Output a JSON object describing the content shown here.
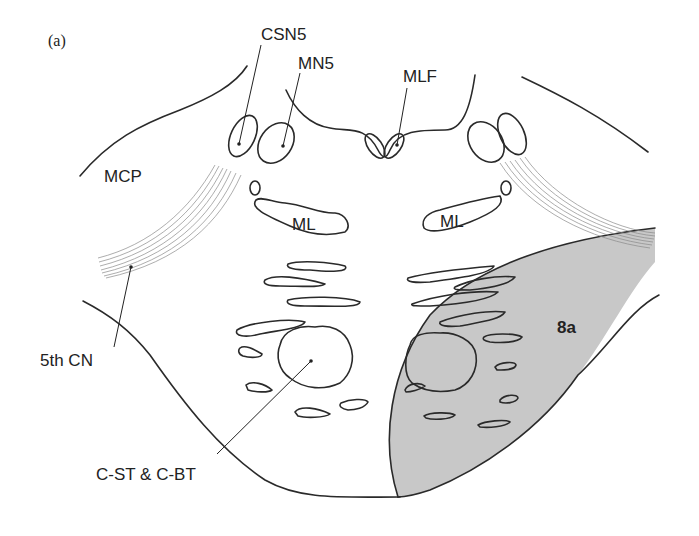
{
  "figure": {
    "panel_label": "(a)",
    "colors": {
      "lesion_fill": "#c8c8c8",
      "line": "#2a2a2a",
      "background": "#ffffff"
    },
    "labels": {
      "csn5": "CSN5",
      "mn5": "MN5",
      "mlf": "MLF",
      "mcp": "MCP",
      "ml_left": "ML",
      "ml_right": "ML",
      "fifth_cn": "5th CN",
      "cst_cbt": "C-ST & C-BT",
      "lesion": "8a"
    }
  }
}
